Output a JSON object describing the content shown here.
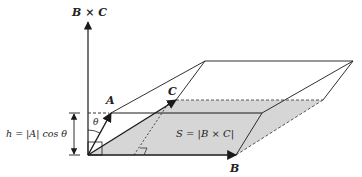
{
  "figure": {
    "type": "parallelepiped-volume-diagram",
    "labels": {
      "cross_product_axis": "B × C",
      "vector_a": "A",
      "vector_b": "B",
      "vector_c": "C",
      "angle": "θ",
      "height_formula": "h = |A| cos θ",
      "base_area_formula": "S = |B × C|"
    },
    "colors": {
      "line": "#1a1a1a",
      "base_fill": "#d4d4d4",
      "background": "#ffffff"
    }
  }
}
